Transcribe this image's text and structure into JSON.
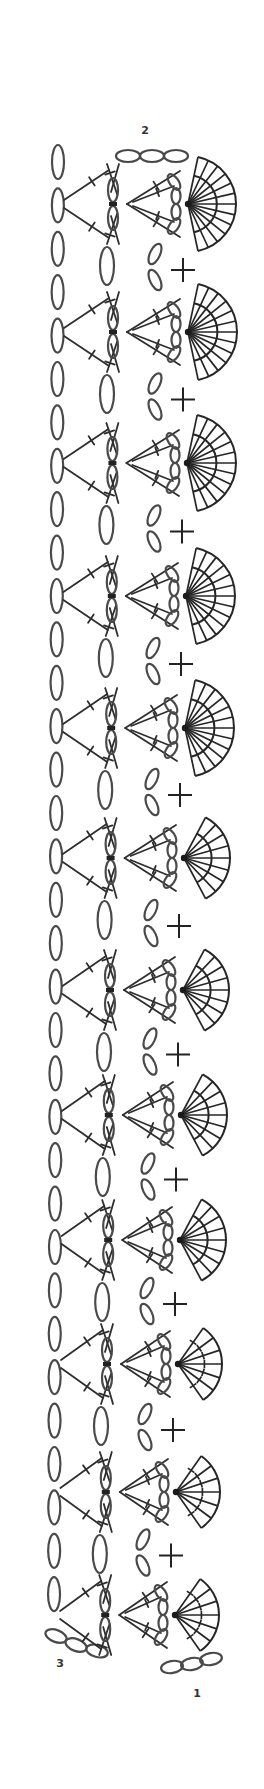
{
  "diagram": {
    "type": "crochet-chart",
    "background": "#ffffff",
    "line_color": "#2e2e2e",
    "row_labels": [
      {
        "text": "2",
        "x": 145,
        "y": 134
      },
      {
        "text": "3",
        "x": 60,
        "y": 1667
      },
      {
        "text": "1",
        "x": 197,
        "y": 1697
      }
    ],
    "top_chain": {
      "y": 156,
      "centers_x": [
        128,
        152,
        176
      ],
      "rx": 12,
      "ry": 6
    },
    "bottom_left_chain": [
      {
        "cx": 56,
        "cy": 1636,
        "rx": 11,
        "ry": 6,
        "rot": 20
      },
      {
        "cx": 76,
        "cy": 1645,
        "rx": 11,
        "ry": 6,
        "rot": 20
      },
      {
        "cx": 97,
        "cy": 1651,
        "rx": 11,
        "ry": 6,
        "rot": 15
      }
    ],
    "bottom_right_chain": [
      {
        "cx": 172,
        "cy": 1667,
        "rx": 11,
        "ry": 6,
        "rot": -10
      },
      {
        "cx": 192,
        "cy": 1664,
        "rx": 11,
        "ry": 6,
        "rot": -10
      },
      {
        "cx": 211,
        "cy": 1659,
        "rx": 11,
        "ry": 6,
        "rot": -10
      }
    ],
    "left_chain_column": {
      "x": 58,
      "rx": 6,
      "ry": 17,
      "start_y": 162,
      "pitch": 43.4,
      "count": 34
    },
    "motifs": [
      {
        "y": 204,
        "hub_x": 188,
        "spokes": 13,
        "radius": 48,
        "span": 78,
        "sc": true
      },
      {
        "y": 332,
        "hub_x": 188,
        "spokes": 13,
        "radius": 49,
        "span": 78,
        "sc": true
      },
      {
        "y": 463,
        "hub_x": 187,
        "spokes": 13,
        "radius": 49,
        "span": 78,
        "sc": true
      },
      {
        "y": 596,
        "hub_x": 186,
        "spokes": 13,
        "radius": 49,
        "span": 78,
        "sc": true
      },
      {
        "y": 728,
        "hub_x": 185,
        "spokes": 13,
        "radius": 49,
        "span": 78,
        "sc": true
      },
      {
        "y": 858,
        "hub_x": 184,
        "spokes": 9,
        "radius": 46,
        "span": 62,
        "sc": true
      },
      {
        "y": 990,
        "hub_x": 183,
        "spokes": 9,
        "radius": 46,
        "span": 62,
        "sc": true
      },
      {
        "y": 1115,
        "hub_x": 181,
        "spokes": 9,
        "radius": 46,
        "span": 62,
        "sc": true
      },
      {
        "y": 1240,
        "hub_x": 180,
        "spokes": 9,
        "radius": 46,
        "span": 62,
        "sc": true
      },
      {
        "y": 1364,
        "hub_x": 178,
        "spokes": 7,
        "radius": 44,
        "span": 55,
        "sc": true
      },
      {
        "y": 1492,
        "hub_x": 176,
        "spokes": 7,
        "radius": 44,
        "span": 55,
        "sc": true
      },
      {
        "y": 1615,
        "hub_x": 175,
        "spokes": 7,
        "radius": 44,
        "span": 55,
        "sc": false
      }
    ],
    "legend": {
      "oval": "chain stitch",
      "plus": "single crochet",
      "crossbar_line": "treble / double crochet",
      "fan": "shell of tall stitches"
    }
  }
}
